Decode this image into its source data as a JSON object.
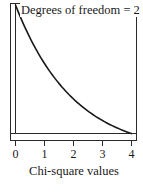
{
  "chart_data": {
    "type": "line",
    "title": "",
    "annotation": "Degrees of freedom = 2",
    "xlabel": "Chi-square values",
    "ylabel": "",
    "x_ticks": [
      "0",
      "1",
      "2",
      "3",
      "4"
    ],
    "xlim": [
      0,
      4
    ],
    "ylim": [
      0,
      0.5
    ],
    "grid": false,
    "legend_position": "top-inside",
    "series": [
      {
        "name": "Chi-square density (df = 2)",
        "x": [
          0,
          0.5,
          1,
          1.5,
          2,
          2.5,
          3,
          3.5,
          4
        ],
        "values": [
          0.5,
          0.389,
          0.303,
          0.236,
          0.184,
          0.143,
          0.112,
          0.087,
          0.068
        ]
      }
    ]
  },
  "labels": {
    "annotation": "Degrees of freedom = 2",
    "tick_0": "0",
    "tick_1": "1",
    "tick_2": "2",
    "tick_3": "3",
    "tick_4": "4",
    "xlabel": "Chi-square values"
  },
  "colors": {
    "line": "#1a1a1a",
    "frame": "#2a2a2a",
    "background": "#ffffff"
  }
}
